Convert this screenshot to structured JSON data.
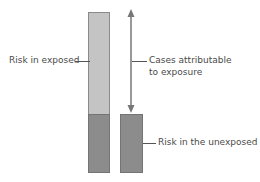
{
  "diagram": {
    "title": "",
    "colors": {
      "exposed_excess": "#c4c4c4",
      "baseline_risk": "#8c8c8c",
      "arrow": "#777777",
      "text": "#4a4a4a"
    },
    "bars": [
      {
        "name": "exposed",
        "segments": [
          {
            "name": "attributable",
            "color": "#c4c4c4"
          },
          {
            "name": "baseline",
            "color": "#8c8c8c"
          }
        ]
      },
      {
        "name": "unexposed",
        "segments": [
          {
            "name": "baseline",
            "color": "#8c8c8c"
          }
        ]
      }
    ],
    "labels": {
      "risk_exposed": "Risk in exposed",
      "attributable_line1": "Cases attributable",
      "attributable_line2": "to exposure",
      "risk_unexposed": "Risk in the unexposed"
    }
  }
}
